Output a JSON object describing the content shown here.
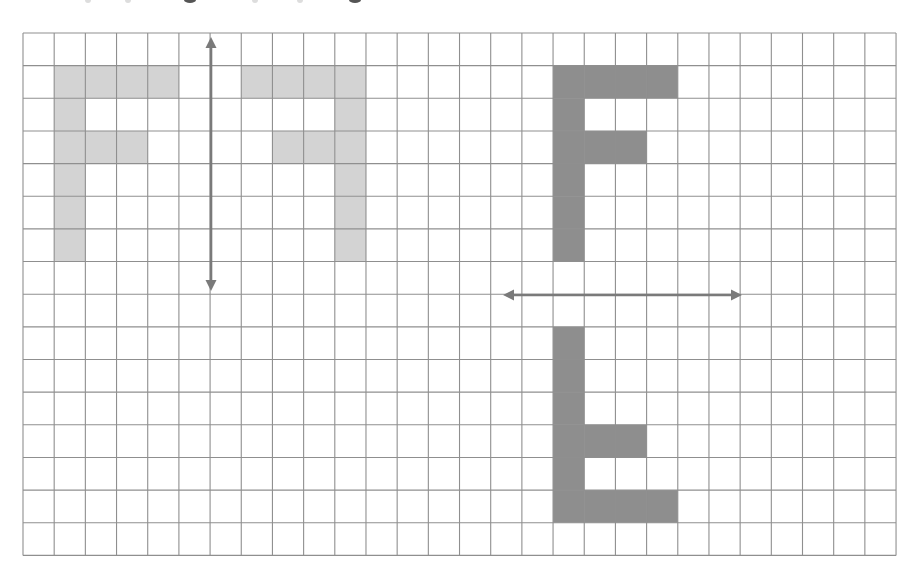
{
  "figure": {
    "top_text_fragment": "",
    "grid": {
      "left": 23,
      "top": 33,
      "cols": 28,
      "rows": 16,
      "cell_width": 31.18,
      "cell_height": 32.65,
      "line_color": "#8f8f8f",
      "background": "#ffffff"
    },
    "colors": {
      "light_fill": "#d3d3d3",
      "dark_fill": "#8e8e8e",
      "arrow": "#7a7a7a"
    },
    "shapes": [
      {
        "name": "original-f-left",
        "fill": "light",
        "cells": [
          [
            1,
            1
          ],
          [
            2,
            1
          ],
          [
            3,
            1
          ],
          [
            4,
            1
          ],
          [
            1,
            2
          ],
          [
            1,
            3
          ],
          [
            2,
            3
          ],
          [
            3,
            3
          ],
          [
            1,
            4
          ],
          [
            1,
            5
          ],
          [
            1,
            6
          ]
        ]
      },
      {
        "name": "mirrored-f-vertical-reflection",
        "fill": "light",
        "cells": [
          [
            7,
            1
          ],
          [
            8,
            1
          ],
          [
            9,
            1
          ],
          [
            10,
            1
          ],
          [
            10,
            2
          ],
          [
            8,
            3
          ],
          [
            9,
            3
          ],
          [
            10,
            3
          ],
          [
            10,
            4
          ],
          [
            10,
            5
          ],
          [
            10,
            6
          ]
        ]
      },
      {
        "name": "original-f-right",
        "fill": "dark",
        "cells": [
          [
            17,
            1
          ],
          [
            18,
            1
          ],
          [
            19,
            1
          ],
          [
            20,
            1
          ],
          [
            17,
            2
          ],
          [
            17,
            3
          ],
          [
            18,
            3
          ],
          [
            19,
            3
          ],
          [
            17,
            4
          ],
          [
            17,
            5
          ],
          [
            17,
            6
          ]
        ]
      },
      {
        "name": "flipped-f-horizontal-reflection",
        "fill": "dark",
        "cells": [
          [
            17,
            9
          ],
          [
            17,
            10
          ],
          [
            17,
            11
          ],
          [
            17,
            12
          ],
          [
            18,
            12
          ],
          [
            19,
            12
          ],
          [
            17,
            13
          ],
          [
            17,
            14
          ],
          [
            18,
            14
          ],
          [
            19,
            14
          ],
          [
            20,
            14
          ]
        ]
      }
    ],
    "lines_of_reflection": [
      {
        "name": "vertical-mirror-line",
        "orientation": "vertical",
        "x": 211,
        "y1": 37,
        "y2": 291
      },
      {
        "name": "horizontal-mirror-line",
        "orientation": "horizontal",
        "y": 295,
        "x1": 503,
        "x2": 742
      }
    ]
  }
}
